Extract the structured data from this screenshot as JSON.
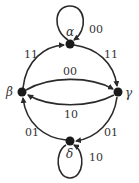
{
  "diagram": {
    "type": "state-transition-graph",
    "nodes": [
      {
        "id": "alpha",
        "label": "α",
        "x": 70,
        "y": 44
      },
      {
        "id": "beta",
        "label": "β",
        "x": 22,
        "y": 92
      },
      {
        "id": "gamma",
        "label": "γ",
        "x": 118,
        "y": 92
      },
      {
        "id": "delta",
        "label": "δ",
        "x": 70,
        "y": 141
      }
    ],
    "edges": [
      {
        "from": "alpha",
        "to": "alpha",
        "label": "00"
      },
      {
        "from": "beta",
        "to": "alpha",
        "label": "11"
      },
      {
        "from": "alpha",
        "to": "gamma",
        "label": "11"
      },
      {
        "from": "beta",
        "to": "gamma",
        "label": "00"
      },
      {
        "from": "gamma",
        "to": "beta",
        "label": "10"
      },
      {
        "from": "delta",
        "to": "beta",
        "label": "01"
      },
      {
        "from": "gamma",
        "to": "delta",
        "label": "01"
      },
      {
        "from": "delta",
        "to": "delta",
        "label": "10"
      }
    ]
  }
}
